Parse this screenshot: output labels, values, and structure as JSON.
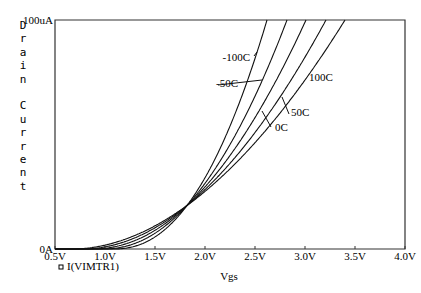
{
  "chart_data": {
    "type": "line",
    "title": "",
    "xlabel": "Vgs",
    "ylabel": "Drain Current",
    "xlim": [
      0.5,
      4.0
    ],
    "ylim": [
      0,
      100
    ],
    "x_ticks": [
      "0.5V",
      "1.0V",
      "1.5V",
      "2.0V",
      "2.5V",
      "3.0V",
      "3.5V",
      "4.0V"
    ],
    "y_ticks": [
      "0A",
      "100uA"
    ],
    "legend": [
      "I(VIMTR1)"
    ],
    "grid": false,
    "crossover_point": {
      "vgs": 1.82,
      "current_uA": 19
    },
    "series": [
      {
        "name": "-100C",
        "x": [
          0.5,
          1.0,
          1.5,
          1.82,
          2.2,
          2.62
        ],
        "values": [
          0,
          0.3,
          6,
          19,
          50,
          100
        ]
      },
      {
        "name": "-50C",
        "x": [
          0.5,
          1.0,
          1.5,
          1.82,
          2.3,
          2.82
        ],
        "values": [
          0,
          0.6,
          7.5,
          19,
          47,
          100
        ]
      },
      {
        "name": "0C",
        "x": [
          0.5,
          1.0,
          1.5,
          1.82,
          2.4,
          3.01
        ],
        "values": [
          0,
          1.0,
          9,
          19,
          44,
          100
        ]
      },
      {
        "name": "50C",
        "x": [
          0.5,
          1.0,
          1.5,
          1.82,
          2.5,
          3.21
        ],
        "values": [
          0,
          1.5,
          10.5,
          19,
          42,
          100
        ]
      },
      {
        "name": "100C",
        "x": [
          0.5,
          1.0,
          1.5,
          1.82,
          2.6,
          3.4
        ],
        "values": [
          0,
          2.0,
          12,
          19,
          40,
          100
        ]
      }
    ]
  },
  "axes": {
    "ylabel": "Drain Current",
    "xlabel": "Vgs",
    "ytop": "100uA",
    "ybottom": "0A",
    "xticks": [
      "0.5V",
      "1.0V",
      "1.5V",
      "2.0V",
      "2.5V",
      "3.0V",
      "3.5V",
      "4.0V"
    ]
  },
  "legend": {
    "trace": "I(VIMTR1)",
    "marker": "square"
  },
  "annotations": [
    "-100C",
    "-50C",
    "0C",
    "50C",
    "100C"
  ]
}
